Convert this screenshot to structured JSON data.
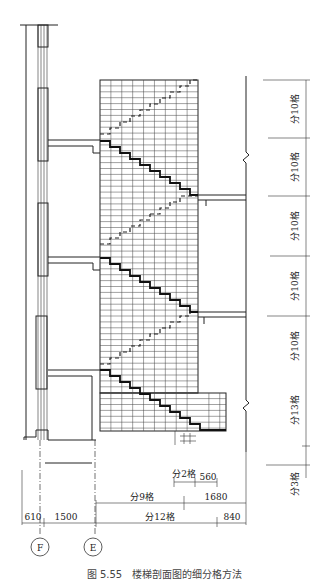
{
  "figure": {
    "caption": "图 5.55　楼梯剖面图的细分格方法"
  },
  "vertical_dimensions": [
    {
      "label": "分10格",
      "y_top": 80,
      "y_bottom": 138
    },
    {
      "label": "分10格",
      "y_top": 138,
      "y_bottom": 196
    },
    {
      "label": "分10格",
      "y_top": 196,
      "y_bottom": 256
    },
    {
      "label": "分10格",
      "y_top": 256,
      "y_bottom": 316
    },
    {
      "label": "分10格",
      "y_top": 316,
      "y_bottom": 374
    },
    {
      "label": "分13格",
      "y_top": 374,
      "y_bottom": 452
    },
    {
      "label": "分3格",
      "y_top": 452,
      "y_bottom": 478
    }
  ],
  "horizontal_dimensions": {
    "row1": [
      {
        "label": "分2格"
      },
      {
        "label": "560"
      }
    ],
    "row2": [
      {
        "label": "分9格"
      },
      {
        "label": "1680"
      }
    ],
    "row3": [
      {
        "label": "610"
      },
      {
        "label": "1500"
      },
      {
        "label": "分12格"
      },
      {
        "label": "840"
      }
    ]
  },
  "axes": [
    {
      "label": "F"
    },
    {
      "label": "E"
    }
  ],
  "grid": {
    "columns": 9,
    "rows": 44
  }
}
